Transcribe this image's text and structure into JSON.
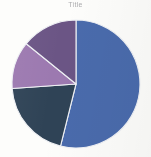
{
  "chart_data": {
    "type": "pie",
    "title": "Title",
    "title_legible": false,
    "xlabel": "",
    "ylabel": "",
    "legend": "none",
    "grid": false,
    "start_angle_deg": 0,
    "direction": "clockwise",
    "categories": [
      "Series 1",
      "Series 2",
      "Series 3",
      "Series 4"
    ],
    "values": [
      54,
      20,
      12,
      14
    ],
    "units": "percent",
    "slices": [
      {
        "label": "Series 1",
        "value": 54,
        "color": "#4a6bac",
        "start_deg": 0,
        "end_deg": 194
      },
      {
        "label": "Series 2",
        "value": 20,
        "color": "#2f4356",
        "start_deg": 194,
        "end_deg": 266
      },
      {
        "label": "Series 3",
        "value": 12,
        "color": "#9c79b0",
        "start_deg": 266,
        "end_deg": 309
      },
      {
        "label": "Series 4",
        "value": 14,
        "color": "#6b5585",
        "start_deg": 309,
        "end_deg": 360
      }
    ],
    "geometry": {
      "cx": 76,
      "cy": 84,
      "r": 64
    },
    "colors": {
      "background": "#fdfdfb",
      "slice_border": "#eef0f4",
      "title_text": "#8c8c90"
    }
  }
}
